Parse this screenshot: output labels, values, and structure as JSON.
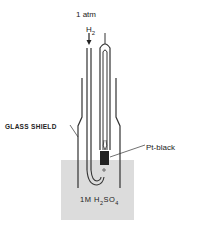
{
  "diagram": {
    "labels": {
      "pressure": "1 atm",
      "gas": "H",
      "gas_sub": "2",
      "shield": "GLASS SHIELD",
      "electrode": "Pt-black",
      "electrolyte_pre": "1M H",
      "electrolyte_sub1": "2",
      "electrolyte_mid": "SO",
      "electrolyte_sub2": "4"
    },
    "colors": {
      "line": "#333333",
      "solution": "#d9d9d9",
      "electrode": "#222222"
    }
  }
}
